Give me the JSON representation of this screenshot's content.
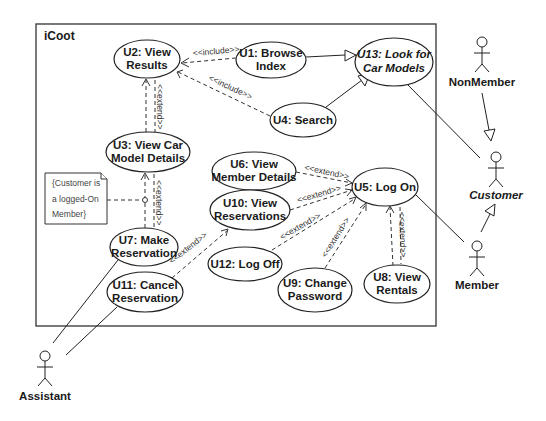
{
  "system": {
    "title": "iCoot"
  },
  "use_cases": {
    "u1": {
      "line1": "U1: Browse",
      "line2": "Index"
    },
    "u2": {
      "line1": "U2: View",
      "line2": "Results"
    },
    "u3": {
      "line1": "U3: View Car",
      "line2": "Model Details"
    },
    "u4": {
      "line1": "U4: Search"
    },
    "u5": {
      "line1": "U5: Log On"
    },
    "u6": {
      "line1": "U6: View",
      "line2": "Member Details"
    },
    "u7": {
      "line1": "U7: Make",
      "line2": "Reservation"
    },
    "u8": {
      "line1": "U8: View",
      "line2": "Rentals"
    },
    "u9": {
      "line1": "U9: Change",
      "line2": "Password"
    },
    "u10": {
      "line1": "U10: View",
      "line2": "Reservations"
    },
    "u11": {
      "line1": "U11: Cancel",
      "line2": "Reservation"
    },
    "u12": {
      "line1": "U12: Log Off"
    },
    "u13": {
      "line1": "U13: Look for",
      "line2": "Car Models"
    }
  },
  "actors": {
    "nonmember": "NonMember",
    "customer": "Customer",
    "member": "Member",
    "assistant": "Assistant"
  },
  "note": {
    "line1": "{Customer is",
    "line2": "a logged-On",
    "line3": "Member}"
  },
  "stereotypes": {
    "include": "<<include>>",
    "extend": "<<extend>>"
  }
}
